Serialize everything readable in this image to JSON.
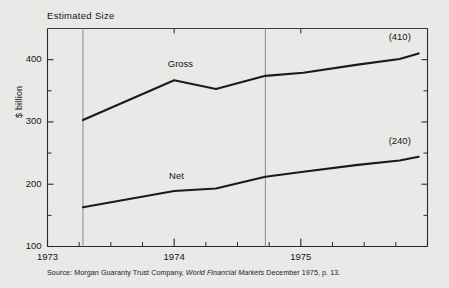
{
  "figure": {
    "title": "Estimated Size",
    "ylabel": "$ billion",
    "source_prefix": "Source: Morgan Guaranty Trust Company,",
    "source_italic": "World Financial Markets",
    "source_suffix": "December 1975, p. 13.",
    "background_color": "#e9e9e7",
    "line_color": "#1a1a1a",
    "gridline_color": "#8a8a8a",
    "axis_color": "#2a2a2a"
  },
  "chart_data": {
    "type": "line",
    "title": "Estimated Size",
    "xlabel": "",
    "ylabel": "$ billion",
    "ylim": [
      100,
      450
    ],
    "xlim": [
      1973.0,
      1976.0
    ],
    "yticks": [
      100,
      200,
      300,
      400
    ],
    "yticks_minor": [
      150,
      250,
      350
    ],
    "ytick_labels": [
      "100",
      "200",
      "300",
      "400"
    ],
    "xticks": [
      1973,
      1974,
      1975
    ],
    "xtick_labels": [
      "1973",
      "1974",
      "1975"
    ],
    "xticks_minor_per_year": 4,
    "grid": false,
    "vertical_reference_lines": [
      1973.28,
      1974.72
    ],
    "legend": "inline-labels",
    "series": [
      {
        "name": "Gross",
        "label": "Gross",
        "label_x": 1974.06,
        "label_y": 392,
        "endpoint_label": "(410)",
        "x": [
          1973.28,
          1974.0,
          1974.33,
          1974.72,
          1975.02,
          1975.45,
          1975.78,
          1975.93
        ],
        "values": [
          303,
          367,
          353,
          374,
          379,
          392,
          401,
          410
        ]
      },
      {
        "name": "Net",
        "label": "Net",
        "label_x": 1974.07,
        "label_y": 212,
        "endpoint_label": "(240)",
        "x": [
          1973.28,
          1974.0,
          1974.33,
          1974.72,
          1975.02,
          1975.45,
          1975.78,
          1975.93
        ],
        "values": [
          163,
          189,
          193,
          212,
          220,
          231,
          238,
          244
        ]
      }
    ]
  }
}
